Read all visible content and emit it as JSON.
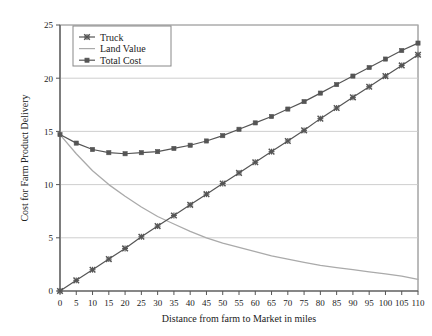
{
  "chart_data": {
    "type": "line",
    "title": "",
    "xlabel": "Distance from farm to Market in miles",
    "ylabel": "Cost for Farm Product Delivery",
    "xlim": [
      0,
      110
    ],
    "ylim": [
      0,
      25
    ],
    "xticks": [
      0,
      5,
      10,
      15,
      20,
      25,
      30,
      35,
      40,
      45,
      50,
      55,
      60,
      65,
      70,
      75,
      80,
      85,
      90,
      95,
      100,
      105,
      110
    ],
    "yticks": [
      0,
      5,
      10,
      15,
      20,
      25
    ],
    "grid": "horizontal",
    "legend_position": "top-left",
    "x": [
      0,
      5,
      10,
      15,
      20,
      25,
      30,
      35,
      40,
      45,
      50,
      55,
      60,
      65,
      70,
      75,
      80,
      85,
      90,
      95,
      100,
      105,
      110
    ],
    "series": [
      {
        "name": "Truck",
        "marker": "x",
        "color": "#555555",
        "values": [
          0.0,
          1.0,
          2.0,
          3.0,
          4.0,
          5.1,
          6.1,
          7.1,
          8.1,
          9.1,
          10.1,
          11.1,
          12.1,
          13.1,
          14.1,
          15.1,
          16.2,
          17.2,
          18.2,
          19.2,
          20.2,
          21.2,
          22.2
        ]
      },
      {
        "name": "Land Value",
        "marker": "none",
        "color": "#aaaaaa",
        "values": [
          14.7,
          12.9,
          11.3,
          10.0,
          8.9,
          7.9,
          7.0,
          6.3,
          5.6,
          5.0,
          4.5,
          4.1,
          3.7,
          3.3,
          3.0,
          2.7,
          2.4,
          2.2,
          2.0,
          1.8,
          1.6,
          1.4,
          1.1
        ]
      },
      {
        "name": "Total Cost",
        "marker": "square",
        "color": "#555555",
        "values": [
          14.7,
          13.9,
          13.3,
          13.0,
          12.9,
          13.0,
          13.1,
          13.4,
          13.7,
          14.1,
          14.6,
          15.2,
          15.8,
          16.4,
          17.1,
          17.8,
          18.6,
          19.4,
          20.2,
          21.0,
          21.8,
          22.6,
          23.3
        ]
      }
    ],
    "legend": [
      "Truck",
      "Land Value",
      "Total Cost"
    ]
  },
  "axes": {
    "y_axis_label": "Cost for Farm Product Delivery",
    "x_axis_label": "Distance from farm to Market in miles",
    "y_tick_labels": [
      "0",
      "5",
      "10",
      "15",
      "20",
      "25"
    ],
    "x_tick_labels": [
      "0",
      "5",
      "10",
      "15",
      "20",
      "25",
      "30",
      "35",
      "40",
      "45",
      "50",
      "55",
      "60",
      "65",
      "70",
      "75",
      "80",
      "85",
      "90",
      "95",
      "100",
      "105",
      "110"
    ]
  },
  "legend": {
    "items": [
      {
        "label": "Truck",
        "marker": "x-marker",
        "color": "#555555"
      },
      {
        "label": "Land Value",
        "marker": "none",
        "color": "#aaaaaa"
      },
      {
        "label": "Total Cost",
        "marker": "square-marker",
        "color": "#555555"
      }
    ]
  },
  "colors": {
    "background": "#ffffff",
    "frame": "#666666",
    "gridline": "#c8c8c8",
    "truck": "#555555",
    "land_value": "#aaaaaa",
    "total_cost": "#555555",
    "text": "#222222"
  }
}
